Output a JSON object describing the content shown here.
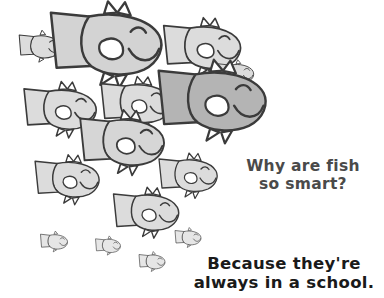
{
  "canvas": {
    "width": 384,
    "height": 298,
    "background": "#ffffff"
  },
  "joke": {
    "question": "Why are fish\nso smart?",
    "punchline": "Because they're\nalways in a school.",
    "question_color": "#4a4a4a",
    "punchline_color": "#1a1a1a"
  },
  "art": {
    "title": "school-of-fish",
    "ink_color": "#3b3b3b",
    "shade_light": "#dcdcdc",
    "shade_mid": "#c9c9c9",
    "shade_dark": "#b4b4b4",
    "highlight": "#f2f2f2",
    "fish_count": 15,
    "fish": [
      {
        "name": "fish-row1-small-left",
        "x": 40,
        "y": 47,
        "scale": 0.4,
        "shade": "#dcdcdc",
        "detail": "simple"
      },
      {
        "name": "fish-row1-large-mid",
        "x": 106,
        "y": 45,
        "scale": 0.95,
        "shade": "#d3d3d3",
        "detail": "full"
      },
      {
        "name": "fish-row1-mid-right",
        "x": 202,
        "y": 48,
        "scale": 0.66,
        "shade": "#dcdcdc",
        "detail": "full"
      },
      {
        "name": "fish-row2-left",
        "x": 60,
        "y": 110,
        "scale": 0.62,
        "shade": "#dcdcdc",
        "detail": "full"
      },
      {
        "name": "fish-row2-mid",
        "x": 136,
        "y": 104,
        "scale": 0.6,
        "shade": "#dcdcdc",
        "detail": "full"
      },
      {
        "name": "fish-row2-right-dark",
        "x": 212,
        "y": 102,
        "scale": 0.92,
        "shade": "#b4b4b4",
        "detail": "full"
      },
      {
        "name": "fish-row3-center",
        "x": 122,
        "y": 143,
        "scale": 0.72,
        "shade": "#d6d6d6",
        "detail": "full"
      },
      {
        "name": "fish-row3-left",
        "x": 67,
        "y": 180,
        "scale": 0.55,
        "shade": "#dcdcdc",
        "detail": "full"
      },
      {
        "name": "fish-row3-right",
        "x": 188,
        "y": 176,
        "scale": 0.5,
        "shade": "#dcdcdc",
        "detail": "full"
      },
      {
        "name": "fish-row4-center",
        "x": 146,
        "y": 213,
        "scale": 0.56,
        "shade": "#dcdcdc",
        "detail": "full"
      },
      {
        "name": "fish-tiny-left",
        "x": 54,
        "y": 242,
        "scale": 0.26,
        "shade": "#e6e6e6",
        "detail": "simple"
      },
      {
        "name": "fish-tiny-midleft",
        "x": 108,
        "y": 246,
        "scale": 0.24,
        "shade": "#e6e6e6",
        "detail": "simple"
      },
      {
        "name": "fish-tiny-right",
        "x": 188,
        "y": 238,
        "scale": 0.25,
        "shade": "#e6e6e6",
        "detail": "simple"
      },
      {
        "name": "fish-tiny-bottom",
        "x": 152,
        "y": 262,
        "scale": 0.25,
        "shade": "#e6e6e6",
        "detail": "simple"
      },
      {
        "name": "fish-row1-partial-edge",
        "x": 236,
        "y": 74,
        "scale": 0.34,
        "shade": "#dcdcdc",
        "detail": "simple"
      }
    ]
  }
}
